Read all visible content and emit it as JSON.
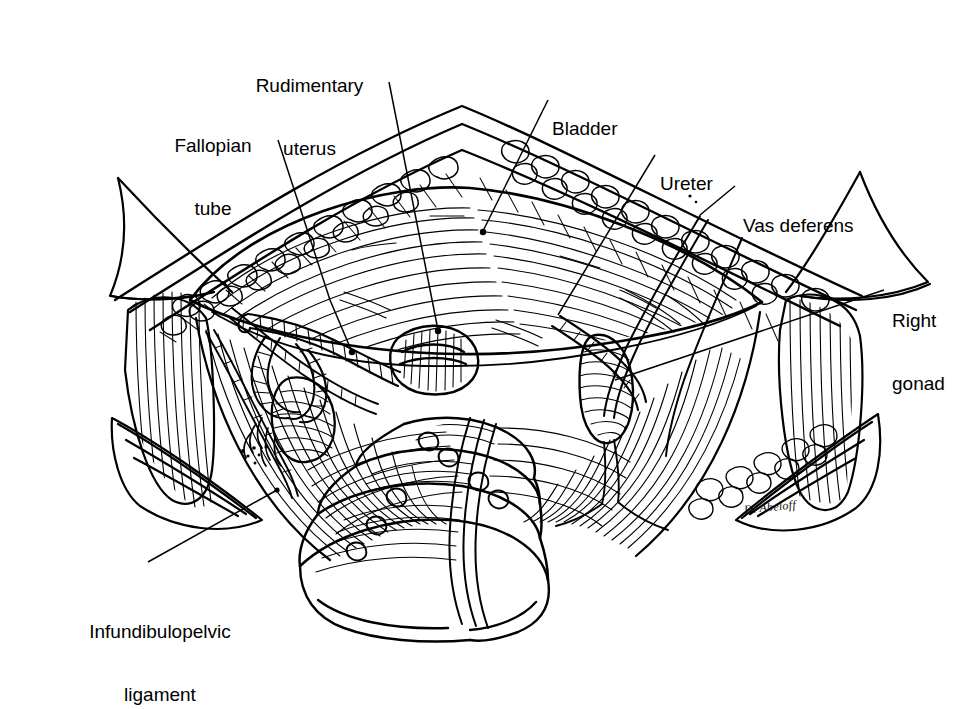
{
  "figure": {
    "background_color": "#ffffff",
    "ink_color": "#000000",
    "width": 980,
    "height": 699,
    "signature": "D. Abeloff"
  },
  "labels": [
    {
      "id": "fallopian-tube",
      "text": "Fallopian\ntube",
      "line1": "Fallopian",
      "line2": "tube",
      "x": 212,
      "y": 92,
      "align": "center"
    },
    {
      "id": "rudimentary-uterus",
      "text": "Rudimentary\nuterus",
      "line1": "Rudimentary",
      "line2": "uterus",
      "x": 308,
      "y": 32,
      "align": "center"
    },
    {
      "id": "bladder",
      "text": "Bladder",
      "line1": "Bladder",
      "line2": "",
      "x": 552,
      "y": 75,
      "align": "left"
    },
    {
      "id": "ureter",
      "text": "Ureter",
      "line1": "Ureter",
      "line2": "",
      "x": 660,
      "y": 130,
      "align": "left"
    },
    {
      "id": "vas-deferens",
      "text": "Vas deferens",
      "line1": "Vas deferens",
      "line2": "",
      "x": 743,
      "y": 172,
      "align": "left"
    },
    {
      "id": "right-gonad",
      "text": "Right\ngonad",
      "line1": "Right",
      "line2": "gonad",
      "x": 892,
      "y": 267,
      "align": "left"
    },
    {
      "id": "infundibulopelvic-ligament",
      "text": "Infundibulopelvic\nligament",
      "line1": "Infundibulopelvic",
      "line2": "ligament",
      "x": 157,
      "y": 578,
      "align": "center"
    }
  ],
  "leaders": [
    {
      "id": "leader-fallopian-tube",
      "points": "278,140 330,300 352,352",
      "dot": "352,352"
    },
    {
      "id": "leader-rudimentary-uterus",
      "points": "389,82 438,330",
      "dot": "438,331"
    },
    {
      "id": "leader-bladder",
      "points": "548,100 483,231",
      "dot": "483,232"
    },
    {
      "id": "leader-ureter",
      "points": "655,155 558,315",
      "dot": null
    },
    {
      "id": "leader-vas-deferens",
      "points": "735,186 700,215",
      "dot": null
    },
    {
      "id": "leader-right-gonad",
      "points": "884,290 615,380",
      "dot": null
    },
    {
      "id": "leader-infundibulopelvic-ligament",
      "points": "148,562 277,490",
      "dot": "277,490"
    }
  ],
  "anatomy": {
    "structures": [
      "anterior abdominal wall flap",
      "bladder dome",
      "rudimentary uterus",
      "left fallopian tube",
      "left streak gonad / ovary",
      "infundibulopelvic ligament",
      "ureter",
      "vas deferens",
      "right gonad",
      "rectosigmoid colon",
      "pelvic sidewall peritoneum"
    ]
  }
}
